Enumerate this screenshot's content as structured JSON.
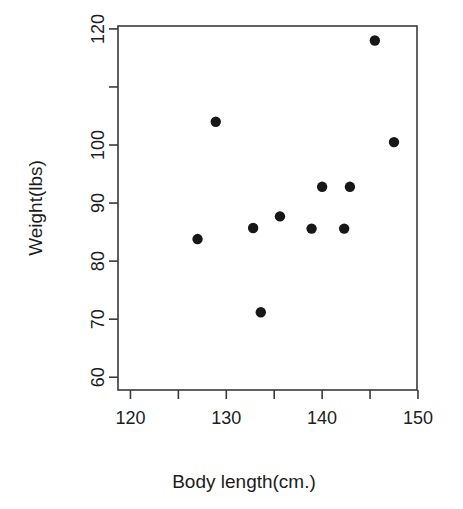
{
  "chart_data": {
    "type": "scatter",
    "title": "",
    "subtitle": "",
    "xlabel": "Body length(cm.)",
    "ylabel": "Weight(lbs)",
    "xlim": [
      118.7,
      149.9
    ],
    "ylim": [
      57.8,
      120.5
    ],
    "grid": false,
    "legend": null,
    "legend_position": "none",
    "x_ticks": [
      120,
      125,
      130,
      135,
      140,
      145,
      150
    ],
    "x_tick_labels": [
      "120",
      "",
      "130",
      "",
      "140",
      "",
      "150"
    ],
    "y_ticks": [
      60,
      70,
      80,
      90,
      100,
      110,
      120
    ],
    "y_tick_labels": [
      "60",
      "70",
      "80",
      "90",
      "100",
      "",
      "120"
    ],
    "point_color": "#171717",
    "point_size": 5.2,
    "marker": "filled-circle",
    "n_points": 11,
    "x": [
      127.0,
      128.9,
      132.8,
      133.6,
      135.6,
      138.9,
      140.0,
      142.3,
      142.9,
      145.5,
      147.5
    ],
    "y": [
      83.8,
      104.0,
      85.7,
      71.2,
      87.7,
      85.6,
      92.8,
      85.6,
      92.8,
      118.0,
      100.5
    ],
    "points": [
      {
        "x": 127.0,
        "y": 83.8
      },
      {
        "x": 128.9,
        "y": 104.0
      },
      {
        "x": 132.8,
        "y": 85.7
      },
      {
        "x": 133.6,
        "y": 71.2
      },
      {
        "x": 135.6,
        "y": 87.7
      },
      {
        "x": 138.9,
        "y": 85.6
      },
      {
        "x": 140.0,
        "y": 92.8
      },
      {
        "x": 142.3,
        "y": 85.6
      },
      {
        "x": 142.9,
        "y": 92.8
      },
      {
        "x": 145.5,
        "y": 118.0
      },
      {
        "x": 147.5,
        "y": 100.5
      }
    ]
  },
  "axes": {
    "x_title": "Body length(cm.)",
    "y_title": "Weight(lbs)"
  },
  "x_tick_labels": [
    {
      "value": 120,
      "label": "120"
    },
    {
      "value": 125,
      "label": ""
    },
    {
      "value": 130,
      "label": "130"
    },
    {
      "value": 135,
      "label": ""
    },
    {
      "value": 140,
      "label": "140"
    },
    {
      "value": 145,
      "label": ""
    },
    {
      "value": 150,
      "label": "150"
    }
  ],
  "y_tick_labels": [
    {
      "value": 60,
      "label": "60"
    },
    {
      "value": 70,
      "label": "70"
    },
    {
      "value": 80,
      "label": "80"
    },
    {
      "value": 90,
      "label": "90"
    },
    {
      "value": 100,
      "label": "100"
    },
    {
      "value": 110,
      "label": ""
    },
    {
      "value": 120,
      "label": "120"
    }
  ],
  "colors": {
    "background": "#ffffff",
    "axis": "#3a3a3a",
    "text": "#1c1c1c",
    "point": "#171717"
  }
}
